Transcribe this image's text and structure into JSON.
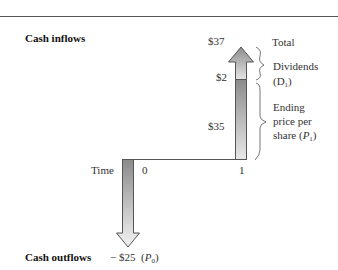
{
  "diagram": {
    "title_inflows": "Cash inflows",
    "title_outflows": "Cash outflows",
    "time_label": "Time",
    "time_points": [
      "0",
      "1"
    ],
    "inflow": {
      "total_value": "$37",
      "total_label": "Total",
      "dividend_value": "$2",
      "dividend_label": "Dividends",
      "dividend_symbol": "(D",
      "dividend_symbol_sub": "1",
      "dividend_symbol_close": ")",
      "price_value": "$35",
      "price_label_line1": "Ending",
      "price_label_line2": "price per",
      "price_label_line3_prefix": "share (",
      "price_symbol": "P",
      "price_symbol_sub": "1",
      "price_label_line3_close": ")"
    },
    "outflow": {
      "value": "− $25",
      "symbol_open": "(",
      "symbol": "P",
      "symbol_sub": "0",
      "symbol_close": ")"
    },
    "colors": {
      "arrow_dark": "#8a8a8a",
      "arrow_light": "#e6e6e6",
      "outline": "#555555",
      "rule": "#555555"
    }
  }
}
